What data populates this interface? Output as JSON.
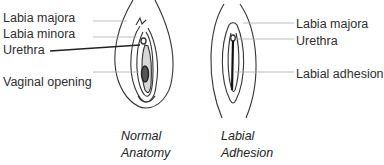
{
  "normal": {
    "labels": {
      "labia_majora": "Labia majora",
      "labia_minora": "Labia minora",
      "urethra": "Urethra",
      "vaginal_opening": "Vaginal opening"
    },
    "caption_line1": "Normal",
    "caption_line2": "Anatomy"
  },
  "adhesion": {
    "labels": {
      "labia_majora": "Labia majora",
      "urethra": "Urethra",
      "labial_adhesion": "Labial adhesion"
    },
    "caption_line1": "Labial",
    "caption_line2": "Adhesion"
  }
}
